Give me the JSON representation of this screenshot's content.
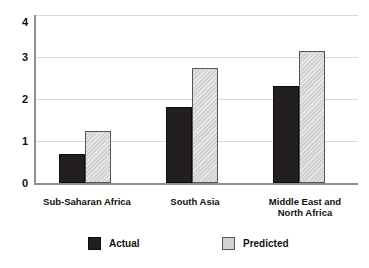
{
  "chart_data": {
    "type": "bar",
    "title": "",
    "subtitle": "",
    "xlabel": "",
    "ylabel": "",
    "ylim": [
      0,
      4
    ],
    "yticks": [
      "0",
      "1",
      "2",
      "3",
      "4"
    ],
    "grid": true,
    "legend_position": "bottom",
    "categories": [
      "Sub-Saharan Africa",
      "South Asia",
      "Middle East and\nNorth Africa"
    ],
    "category_lines": [
      [
        "Sub-Saharan Africa"
      ],
      [
        "South Asia"
      ],
      [
        "Middle East and",
        "North Africa"
      ]
    ],
    "series": [
      {
        "name": "Actual",
        "color": "#231f20",
        "values": [
          0.7,
          1.8,
          2.3
        ]
      },
      {
        "name": "Predicted",
        "color": "#d2d2d2",
        "values": [
          1.25,
          2.75,
          3.15
        ]
      }
    ]
  },
  "axis": {
    "tick_0": "0",
    "tick_1": "1",
    "tick_2": "2",
    "tick_3": "3",
    "tick_4": "4"
  },
  "legend": {
    "actual_label": "Actual",
    "predicted_label": "Predicted"
  },
  "categories": {
    "c0_line0": "Sub-Saharan Africa",
    "c1_line0": "South Asia",
    "c2_line0": "Middle East and",
    "c2_line1": "North Africa"
  }
}
